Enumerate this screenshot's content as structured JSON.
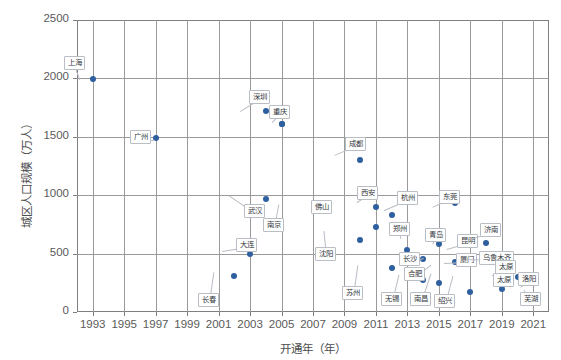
{
  "chart_data": {
    "type": "scatter",
    "title": "",
    "xlabel": "开通年（年）",
    "ylabel": "城区人口规模（万人）",
    "xlim": [
      1992,
      2022
    ],
    "ylim": [
      0,
      2500
    ],
    "xticks": [
      "1993",
      "1995",
      "1997",
      "1999",
      "2001",
      "2003",
      "2005",
      "2007",
      "2009",
      "2011",
      "2013",
      "2015",
      "2017",
      "2019",
      "2021"
    ],
    "yticks": [
      "0",
      "500",
      "1000",
      "1500",
      "2000",
      "2500"
    ],
    "grid": true,
    "legend": "none",
    "series_color": "#2e5f9e",
    "points": [
      {
        "label": "上海",
        "x": 1993,
        "y": 1995
      },
      {
        "label": "广州",
        "x": 1997,
        "y": 1490
      },
      {
        "label": "长春",
        "x": 2002,
        "y": 310
      },
      {
        "label": "大连",
        "x": 2003,
        "y": 500
      },
      {
        "label": "武汉",
        "x": 2004,
        "y": 970
      },
      {
        "label": "深圳",
        "x": 2004,
        "y": 1725
      },
      {
        "label": "南京",
        "x": 2005,
        "y": 1610
      },
      {
        "label": "重庆",
        "x": 2005,
        "y": 1610
      },
      {
        "label": "沈阳",
        "x": 2010,
        "y": 620
      },
      {
        "label": "成都",
        "x": 2010,
        "y": 1300
      },
      {
        "label": "佛山",
        "x": 2011,
        "y": 730
      },
      {
        "label": "西安",
        "x": 2011,
        "y": 900
      },
      {
        "label": "苏州",
        "x": 2012,
        "y": 380
      },
      {
        "label": "杭州",
        "x": 2012,
        "y": 830
      },
      {
        "label": "郑州",
        "x": 2013,
        "y": 530
      },
      {
        "label": "无锡",
        "x": 2014,
        "y": 270
      },
      {
        "label": "长沙",
        "x": 2014,
        "y": 450
      },
      {
        "label": "青岛",
        "x": 2015,
        "y": 580
      },
      {
        "label": "南昌",
        "x": 2015,
        "y": 250
      },
      {
        "label": "合肥",
        "x": 2016,
        "y": 430
      },
      {
        "label": "东莞",
        "x": 2016,
        "y": 930
      },
      {
        "label": "厦门",
        "x": 2017,
        "y": 450
      },
      {
        "label": "昆明",
        "x": 2017,
        "y": 480
      },
      {
        "label": "绍兴",
        "x": 2017,
        "y": 170
      },
      {
        "label": "济南",
        "x": 2018,
        "y": 590
      },
      {
        "label": "呼和浩特",
        "x": 2019,
        "y": 200
      },
      {
        "label": "乌鲁木齐",
        "x": 2018,
        "y": 450
      },
      {
        "label": "太原",
        "x": 2020,
        "y": 300
      },
      {
        "label": "洛阳",
        "x": 2021,
        "y": 110
      },
      {
        "label": "芜湖",
        "x": 2021,
        "y": 110
      }
    ],
    "callouts": [
      {
        "label": "上海",
        "lx": 64,
        "ly": 56,
        "px": 80,
        "py": 80
      },
      {
        "label": "广州",
        "lx": 130,
        "ly": 130,
        "px": 155,
        "py": 140
      },
      {
        "label": "长春",
        "lx": 198,
        "ly": 293,
        "px": 213,
        "py": 272
      },
      {
        "label": "大连",
        "lx": 236,
        "ly": 238,
        "px": 222,
        "py": 252
      },
      {
        "label": "武汉",
        "lx": 244,
        "ly": 204,
        "px": 228,
        "py": 196
      },
      {
        "label": "深圳",
        "lx": 249,
        "ly": 90,
        "px": 240,
        "py": 112
      },
      {
        "label": "南京",
        "lx": 263,
        "ly": 218,
        "px": 278,
        "py": 204
      },
      {
        "label": "重庆",
        "lx": 269,
        "ly": 105,
        "px": 272,
        "py": 123
      },
      {
        "label": "沈阳",
        "lx": 315,
        "ly": 247,
        "px": 323,
        "py": 231
      },
      {
        "label": "成都",
        "lx": 345,
        "ly": 137,
        "px": 334,
        "py": 156
      },
      {
        "label": "佛山",
        "lx": 311,
        "ly": 200,
        "px": 323,
        "py": 212
      },
      {
        "label": "西安",
        "lx": 357,
        "ly": 186,
        "px": 357,
        "py": 203
      },
      {
        "label": "杭州",
        "lx": 397,
        "ly": 191,
        "px": 384,
        "py": 211
      },
      {
        "label": "苏州",
        "lx": 342,
        "ly": 286,
        "px": 357,
        "py": 265
      },
      {
        "label": "郑州",
        "lx": 389,
        "ly": 222,
        "px": 401,
        "py": 239
      },
      {
        "label": "无锡",
        "lx": 381,
        "ly": 292,
        "px": 398,
        "py": 275
      },
      {
        "label": "长沙",
        "lx": 399,
        "ly": 252,
        "px": 423,
        "py": 258
      },
      {
        "label": "青岛",
        "lx": 425,
        "ly": 228,
        "px": 433,
        "py": 244
      },
      {
        "label": "合肥",
        "lx": 404,
        "ly": 267,
        "px": 430,
        "py": 265
      },
      {
        "label": "南昌",
        "lx": 410,
        "ly": 292,
        "px": 430,
        "py": 274
      },
      {
        "label": "东莞",
        "lx": 439,
        "ly": 190,
        "px": 432,
        "py": 208
      },
      {
        "label": "昆明",
        "lx": 457,
        "ly": 234,
        "px": 446,
        "py": 250
      },
      {
        "label": "厦门",
        "lx": 456,
        "ly": 253,
        "px": 444,
        "py": 264
      },
      {
        "label": "绍兴",
        "lx": 434,
        "ly": 294,
        "px": 452,
        "py": 276
      },
      {
        "label": "济南",
        "lx": 480,
        "ly": 223,
        "px": 468,
        "py": 241
      },
      {
        "label": "乌鲁木齐",
        "lx": 479,
        "ly": 251,
        "px": 466,
        "py": 260
      },
      {
        "label": "太原",
        "lx": 495,
        "ly": 260,
        "px": 492,
        "py": 276
      },
      {
        "label": "太原",
        "lx": 493,
        "ly": 273,
        "px": 492,
        "py": 276
      },
      {
        "label": "洛阳",
        "lx": 518,
        "ly": 272,
        "px": 520,
        "py": 288
      },
      {
        "label": "芜湖",
        "lx": 520,
        "ly": 292,
        "px": 523,
        "py": 290
      }
    ]
  }
}
